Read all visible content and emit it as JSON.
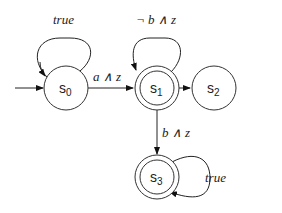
{
  "diagram": {
    "type": "automaton",
    "states": [
      {
        "id": "s0",
        "name": "s",
        "sub": "0",
        "initial": true,
        "accepting": false
      },
      {
        "id": "s1",
        "name": "s",
        "sub": "1",
        "initial": false,
        "accepting": true
      },
      {
        "id": "s2",
        "name": "s",
        "sub": "2",
        "initial": false,
        "accepting": false
      },
      {
        "id": "s3",
        "name": "s",
        "sub": "3",
        "initial": false,
        "accepting": true
      }
    ],
    "transitions": [
      {
        "from": "s0",
        "to": "s0",
        "label": "true"
      },
      {
        "from": "s0",
        "to": "s1",
        "label": "a ∧ z"
      },
      {
        "from": "s1",
        "to": "s1",
        "label": "¬ b ∧ z"
      },
      {
        "from": "s1",
        "to": "s2",
        "label": "c"
      },
      {
        "from": "s1",
        "to": "s3",
        "label": "b ∧ z"
      },
      {
        "from": "s3",
        "to": "s3",
        "label": "true"
      }
    ]
  }
}
